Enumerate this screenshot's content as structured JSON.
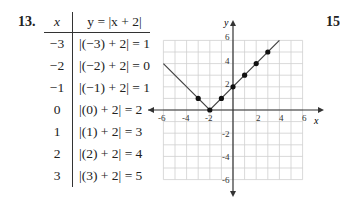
{
  "problem": {
    "number": "13.",
    "next_number_partial": "15"
  },
  "table": {
    "headers": {
      "x": "x",
      "y": "y = |x + 2|"
    },
    "rows": [
      {
        "x": "−3",
        "expr": "|(−3) + 2| = 1"
      },
      {
        "x": "−2",
        "expr": "|(−2) + 2| = 0"
      },
      {
        "x": "−1",
        "expr": "|(−1) + 2| = 1"
      },
      {
        "x": "0",
        "expr": "|(0) + 2| = 2"
      },
      {
        "x": "1",
        "expr": "|(1) + 2| = 3"
      },
      {
        "x": "2",
        "expr": "|(2) + 2| = 4"
      },
      {
        "x": "3",
        "expr": "|(3) + 2| = 5"
      }
    ]
  },
  "graph": {
    "x_axis_label": "x",
    "y_axis_label": "y",
    "x_ticks": [
      "-6",
      "-4",
      "-2",
      "2",
      "4",
      "6"
    ],
    "y_ticks": [
      "6",
      "4",
      "2",
      "-2",
      "-4",
      "-6"
    ]
  },
  "chart_data": {
    "type": "line",
    "title": "y = |x + 2|",
    "xlabel": "x",
    "ylabel": "y",
    "xlim": [
      -6,
      6
    ],
    "ylim": [
      -6,
      6
    ],
    "grid": true,
    "line": {
      "x": [
        -6,
        -2,
        4
      ],
      "y": [
        4,
        0,
        6
      ]
    },
    "points": {
      "x": [
        -3,
        -2,
        -1,
        0,
        1,
        2,
        3
      ],
      "y": [
        1,
        0,
        1,
        2,
        3,
        4,
        5
      ]
    },
    "x_ticks": [
      -6,
      -4,
      -2,
      2,
      4,
      6
    ],
    "y_ticks": [
      -6,
      -4,
      -2,
      2,
      4,
      6
    ]
  }
}
